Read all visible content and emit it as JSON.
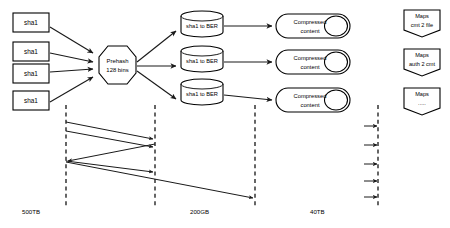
{
  "diagram": {
    "colors": {
      "stroke": "#000000",
      "fill": "#ffffff",
      "edge": "#1a1a1a"
    },
    "inputs": [
      {
        "label": "sha1"
      },
      {
        "label": "sha1"
      },
      {
        "label": "sha1"
      },
      {
        "label": "sha1"
      }
    ],
    "prehash": {
      "line1": "Prehash",
      "line2": "128 bins"
    },
    "stores": [
      {
        "label": "sha1 to BER"
      },
      {
        "label": "sha1 to BER"
      },
      {
        "label": "sha1 to BER"
      }
    ],
    "outputs": [
      {
        "line1": "Compressed",
        "line2": "content"
      },
      {
        "line1": "Compressed",
        "line2": "content"
      },
      {
        "line1": "Compressed",
        "line2": "content"
      }
    ],
    "maps": [
      {
        "line1": "Maps",
        "line2": "cmt 2 file"
      },
      {
        "line1": "Maps",
        "line2": "auth 2 cmt"
      },
      {
        "line1": "Maps",
        "line2": "....."
      }
    ],
    "scale_labels": [
      {
        "text": "500TB"
      },
      {
        "text": "200GB"
      },
      {
        "text": "40TB"
      }
    ]
  }
}
